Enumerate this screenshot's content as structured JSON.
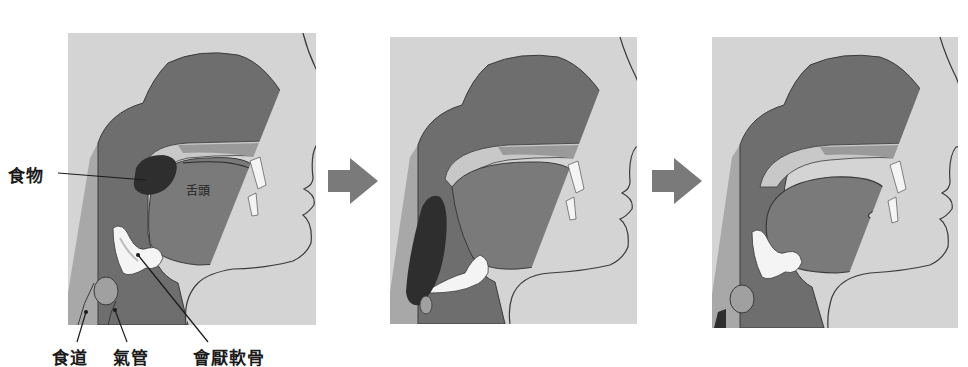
{
  "figure": {
    "type": "sequential anatomical diagram",
    "panels": [
      {
        "step": 1,
        "description": "food on tongue, epiglottis open"
      },
      {
        "step": 2,
        "description": "food bolus passing into esophagus, epiglottis closed over trachea"
      },
      {
        "step": 3,
        "description": "food passed into esophagus, epiglottis returns upright"
      }
    ],
    "arrows": [
      {
        "from_step": 1,
        "to_step": 2,
        "symbol": "arrow-right"
      },
      {
        "from_step": 2,
        "to_step": 3,
        "symbol": "arrow-right"
      }
    ]
  },
  "labels": {
    "food": "食物",
    "tongue": "舌頭",
    "esophagus": "食道",
    "trachea": "氣管",
    "epiglottis": "會厭軟骨"
  },
  "colors": {
    "panel_bg": "#d4d4d4",
    "tissue_dark": "#6e6e6e",
    "tissue_mid": "#8a8a8a",
    "tissue_light": "#a8a8a8",
    "cartilage": "#f4f4f4",
    "food": "#2e2e2e",
    "outline": "#3a3a3a",
    "arrow": "#7a7a7a"
  }
}
